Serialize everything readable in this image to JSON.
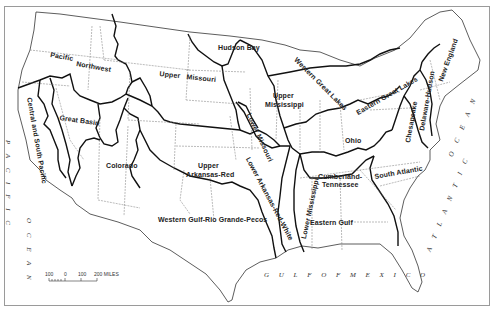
{
  "map": {
    "type": "water resource regions outline map",
    "regions": [
      {
        "id": "pacific-northwest",
        "label_line1": "Pacific",
        "label_line2": "Northwest"
      },
      {
        "id": "upper-missouri",
        "label_line1": "Upper",
        "label_line2": "Missouri"
      },
      {
        "id": "hudson-bay",
        "label": "Hudson Bay"
      },
      {
        "id": "western-great-lakes",
        "label": "Western Great Lakes"
      },
      {
        "id": "eastern-great-lakes",
        "label": "Eastern Great Lakes"
      },
      {
        "id": "new-england",
        "label": "New England"
      },
      {
        "id": "delaware-hudson",
        "label": "Delaware-Hudson"
      },
      {
        "id": "chesapeake",
        "label": "Chesapeake"
      },
      {
        "id": "upper-mississippi",
        "label_line1": "Upper",
        "label_line2": "Mississippi"
      },
      {
        "id": "lower-missouri",
        "label": "Lower Missouri"
      },
      {
        "id": "ohio",
        "label": "Ohio"
      },
      {
        "id": "great-basin",
        "label": "Great Basin"
      },
      {
        "id": "central-south-pacific",
        "label": "Central and South Pacific"
      },
      {
        "id": "colorado",
        "label": "Colorado"
      },
      {
        "id": "upper-arkansas-red",
        "label_line1": "Upper",
        "label_line2": "Arkansas-Red"
      },
      {
        "id": "lower-arkansas-red-white",
        "label": "Lower Arkansas-Red-White"
      },
      {
        "id": "lower-mississippi",
        "label": "Lower Mississippi"
      },
      {
        "id": "cumberland-tennessee",
        "label_line1": "Cumberland-",
        "label_line2": "Tennessee"
      },
      {
        "id": "south-atlantic",
        "label": "South Atlantic"
      },
      {
        "id": "eastern-gulf",
        "label": "Eastern Gulf"
      },
      {
        "id": "western-gulf",
        "label": "Western Gulf-Rio Grande-Pecos"
      }
    ],
    "water_bodies": {
      "pacific": "P A C I F I C",
      "pacific_ocean": "O C E A N",
      "atlantic": "A T L A N T I C",
      "atlantic_ocean": "O C E A N",
      "gulf": "G U L F   O F   M E X I C O"
    },
    "scale_bar": {
      "ticks": [
        "100",
        "0",
        "100",
        "200 MILES"
      ]
    }
  }
}
